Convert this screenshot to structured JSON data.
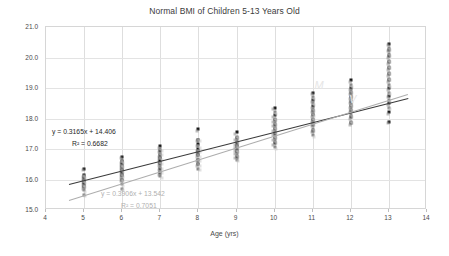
{
  "chart_data": {
    "type": "scatter",
    "title": "Normal BMI of Children 5-13 Years Old",
    "xlabel": "Age (yrs)",
    "ylabel": "BMI (kg/m²)",
    "xlim": [
      4,
      14
    ],
    "ylim": [
      15.0,
      21.0
    ],
    "xticks": [
      4,
      5,
      6,
      7,
      8,
      9,
      10,
      11,
      12,
      13,
      14
    ],
    "yticks": [
      "15.0",
      "16.0",
      "17.0",
      "18.0",
      "19.0",
      "20.0",
      "21.0"
    ],
    "grid": true,
    "legend": "none",
    "series": [
      {
        "name": "Series 1",
        "color": "#1a1a1a",
        "marker": "square",
        "points": [
          [
            5,
            16.35
          ],
          [
            5,
            16.15
          ],
          [
            5,
            16.05
          ],
          [
            5,
            15.95
          ],
          [
            5,
            15.85
          ],
          [
            5,
            15.75
          ],
          [
            6,
            16.75
          ],
          [
            6,
            16.6
          ],
          [
            6,
            16.5
          ],
          [
            6,
            16.4
          ],
          [
            6,
            16.3
          ],
          [
            6,
            16.2
          ],
          [
            6,
            16.1
          ],
          [
            6,
            16.0
          ],
          [
            7,
            17.1
          ],
          [
            7,
            16.95
          ],
          [
            7,
            16.8
          ],
          [
            7,
            16.7
          ],
          [
            7,
            16.6
          ],
          [
            7,
            16.5
          ],
          [
            7,
            16.35
          ],
          [
            7,
            16.2
          ],
          [
            8,
            17.65
          ],
          [
            8,
            17.3
          ],
          [
            8,
            17.15
          ],
          [
            8,
            17.0
          ],
          [
            8,
            16.9
          ],
          [
            8,
            16.8
          ],
          [
            8,
            16.65
          ],
          [
            8,
            16.5
          ],
          [
            9,
            17.55
          ],
          [
            9,
            17.35
          ],
          [
            9,
            17.2
          ],
          [
            9,
            17.1
          ],
          [
            9,
            17.0
          ],
          [
            9,
            16.9
          ],
          [
            9,
            16.75
          ],
          [
            10,
            18.35
          ],
          [
            10,
            18.1
          ],
          [
            10,
            17.95
          ],
          [
            10,
            17.8
          ],
          [
            10,
            17.65
          ],
          [
            10,
            17.5
          ],
          [
            10,
            17.35
          ],
          [
            10,
            17.2
          ],
          [
            11,
            18.85
          ],
          [
            11,
            18.6
          ],
          [
            11,
            18.4
          ],
          [
            11,
            18.25
          ],
          [
            11,
            18.1
          ],
          [
            11,
            17.95
          ],
          [
            11,
            17.8
          ],
          [
            11,
            17.6
          ],
          [
            12,
            19.25
          ],
          [
            12,
            19.0
          ],
          [
            12,
            18.85
          ],
          [
            12,
            18.7
          ],
          [
            12,
            18.55
          ],
          [
            12,
            18.4
          ],
          [
            12,
            18.25
          ],
          [
            12,
            18.05
          ],
          [
            12,
            17.85
          ],
          [
            13,
            20.45
          ],
          [
            13,
            20.25
          ],
          [
            13,
            20.05
          ],
          [
            13,
            19.85
          ],
          [
            13,
            19.65
          ],
          [
            13,
            19.45
          ],
          [
            13,
            19.25
          ],
          [
            13,
            19.0
          ],
          [
            13,
            18.75
          ],
          [
            13,
            18.5
          ],
          [
            13,
            18.2
          ],
          [
            13,
            17.9
          ]
        ]
      },
      {
        "name": "Series 2",
        "color": "#8a8a8a",
        "marker": "square",
        "points": [
          [
            5,
            16.1
          ],
          [
            5,
            15.95
          ],
          [
            5,
            15.8
          ],
          [
            5,
            15.65
          ],
          [
            5,
            15.5
          ],
          [
            6,
            16.6
          ],
          [
            6,
            16.45
          ],
          [
            6,
            16.3
          ],
          [
            6,
            16.15
          ],
          [
            6,
            16.0
          ],
          [
            6,
            15.85
          ],
          [
            6,
            15.7
          ],
          [
            7,
            17.0
          ],
          [
            7,
            16.85
          ],
          [
            7,
            16.7
          ],
          [
            7,
            16.55
          ],
          [
            7,
            16.4
          ],
          [
            7,
            16.25
          ],
          [
            7,
            16.1
          ],
          [
            8,
            17.3
          ],
          [
            8,
            17.1
          ],
          [
            8,
            16.95
          ],
          [
            8,
            16.8
          ],
          [
            8,
            16.65
          ],
          [
            8,
            16.5
          ],
          [
            8,
            16.35
          ],
          [
            9,
            17.4
          ],
          [
            9,
            17.25
          ],
          [
            9,
            17.1
          ],
          [
            9,
            16.95
          ],
          [
            9,
            16.8
          ],
          [
            9,
            16.65
          ],
          [
            10,
            18.2
          ],
          [
            10,
            18.0
          ],
          [
            10,
            17.85
          ],
          [
            10,
            17.7
          ],
          [
            10,
            17.55
          ],
          [
            10,
            17.4
          ],
          [
            10,
            17.25
          ],
          [
            10,
            17.05
          ],
          [
            11,
            18.7
          ],
          [
            11,
            18.5
          ],
          [
            11,
            18.3
          ],
          [
            11,
            18.15
          ],
          [
            11,
            18.0
          ],
          [
            11,
            17.85
          ],
          [
            11,
            17.65
          ],
          [
            11,
            17.45
          ],
          [
            12,
            19.1
          ],
          [
            12,
            18.9
          ],
          [
            12,
            18.75
          ],
          [
            12,
            18.6
          ],
          [
            12,
            18.45
          ],
          [
            12,
            18.3
          ],
          [
            12,
            18.1
          ],
          [
            12,
            17.9
          ],
          [
            13,
            20.3
          ],
          [
            13,
            20.1
          ],
          [
            13,
            19.9
          ],
          [
            13,
            19.7
          ],
          [
            13,
            19.5
          ],
          [
            13,
            19.3
          ],
          [
            13,
            19.1
          ],
          [
            13,
            18.85
          ],
          [
            13,
            18.6
          ],
          [
            13,
            18.35
          ]
        ]
      }
    ],
    "trendlines": [
      {
        "name": "trendline-dark",
        "equation": "y = 0.3165x + 14.406",
        "r2": "R² = 0.6682",
        "slope": 0.3165,
        "intercept": 14.406,
        "color": "#3a3a3a",
        "x_start": 4.6,
        "x_end": 13.5
      },
      {
        "name": "trendline-gray",
        "equation": "y = 0.3906x + 13.542",
        "r2": "R² = 0.7051",
        "slope": 0.3906,
        "intercept": 13.542,
        "color": "#adadad",
        "x_start": 4.6,
        "x_end": 13.5
      }
    ],
    "annotations": [
      {
        "name": "watermark-left",
        "text": "M",
        "x": 11.05,
        "y": 19.28
      },
      {
        "name": "watermark-right",
        "text": "V",
        "x": 11.95,
        "y": 18.85
      }
    ]
  }
}
